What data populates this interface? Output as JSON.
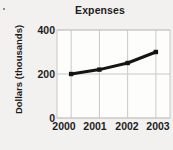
{
  "chart_data": {
    "type": "line",
    "title": "Expenses",
    "xlabel": "",
    "ylabel": "Dollars (thousands)",
    "categories": [
      "2000",
      "2001",
      "2002",
      "2003"
    ],
    "values": [
      200,
      220,
      250,
      300
    ],
    "x": [
      2000,
      2001,
      2002,
      2003
    ],
    "ylim": [
      0,
      400
    ],
    "yticks": [
      "0",
      "200",
      "400"
    ],
    "ytick_values": [
      0,
      200,
      400
    ],
    "xticks": [
      "2000",
      "2001",
      "2002",
      "2003"
    ],
    "grid": true,
    "legend": false,
    "legend_position": "none",
    "series": [
      {
        "name": "Expenses",
        "values": [
          200,
          220,
          250,
          300
        ],
        "color": "#141414",
        "marker": "square",
        "line_width": 3
      }
    ]
  },
  "colors": {
    "background": "#f2f1ef",
    "plot_background": "#fdfdfc",
    "grid": "#c9c8c5",
    "axis_text": "#1d1d1d",
    "series": "#141414"
  },
  "axis": {
    "y_tick_labels": [
      {
        "text": "400",
        "top": 25
      },
      {
        "text": "200",
        "top": 69
      },
      {
        "text": "0",
        "top": 113
      }
    ],
    "x_tick_labels": [
      {
        "text": "2000",
        "left": 47
      },
      {
        "text": "2001",
        "left": 78
      },
      {
        "text": "2002",
        "left": 110
      },
      {
        "text": "2003",
        "left": 141
      }
    ]
  }
}
